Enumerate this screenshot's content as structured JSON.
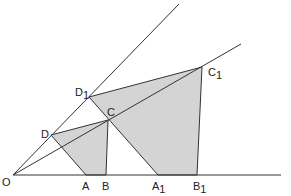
{
  "colors": {
    "background": "#ffffff",
    "line": "#333333",
    "fill": "#d4d4d4",
    "text": "#222222"
  },
  "points": {
    "O": {
      "label": "O",
      "sub": "",
      "x": 13,
      "y": 175
    },
    "A": {
      "label": "A",
      "sub": "",
      "x": 86,
      "y": 175
    },
    "B": {
      "label": "B",
      "sub": "",
      "x": 106,
      "y": 175
    },
    "C": {
      "label": "C",
      "sub": "",
      "x": 108,
      "y": 120
    },
    "D": {
      "label": "D",
      "sub": "",
      "x": 51,
      "y": 135
    },
    "A1": {
      "label": "A",
      "sub": "1",
      "x": 158,
      "y": 175
    },
    "B1": {
      "label": "B",
      "sub": "1",
      "x": 197,
      "y": 175
    },
    "C1": {
      "label": "C",
      "sub": "1",
      "x": 202,
      "y": 67
    },
    "D1": {
      "label": "D",
      "sub": "1",
      "x": 89,
      "y": 97
    }
  },
  "labels": {
    "O": "O",
    "A": "A",
    "B": "B",
    "C": "C",
    "D": "D",
    "A1": "A",
    "A1_sub": "1",
    "B1": "B",
    "B1_sub": "1",
    "C1": "C",
    "C1_sub": "1",
    "D1": "D",
    "D1_sub": "1"
  },
  "shapes": {
    "small_quad": [
      "D",
      "C",
      "B",
      "A"
    ],
    "large_quad": [
      "D1",
      "C1",
      "B1",
      "A1"
    ]
  },
  "rays": [
    {
      "from": "O",
      "to": [
        179,
        4
      ],
      "name": "upper-ray"
    },
    {
      "from": "O",
      "to": [
        241,
        44
      ],
      "name": "middle-ray"
    },
    {
      "from": "O",
      "to": [
        281,
        175
      ],
      "name": "baseline"
    }
  ]
}
